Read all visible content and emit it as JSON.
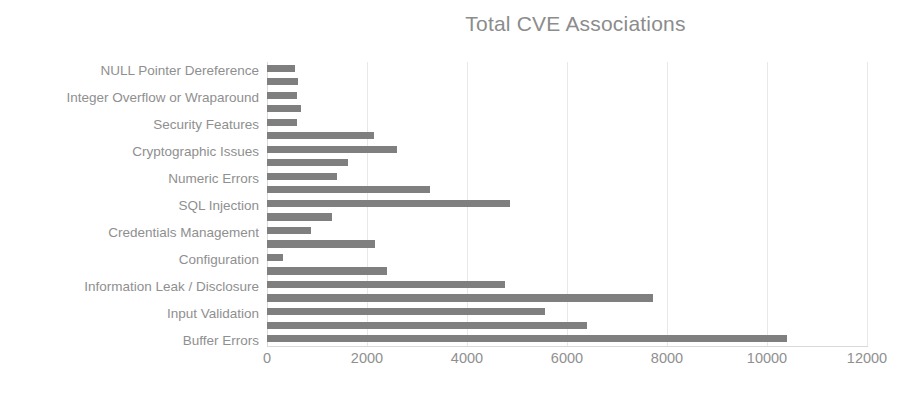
{
  "chart_data": {
    "type": "bar",
    "orientation": "horizontal",
    "title": "Total CVE Associations",
    "xlabel": "",
    "ylabel": "",
    "xlim": [
      0,
      12000
    ],
    "xticks": [
      0,
      2000,
      4000,
      6000,
      8000,
      10000,
      12000
    ],
    "xtick_labels": [
      "0",
      "2000",
      "4000",
      "6000",
      "8000",
      "10000",
      "12000"
    ],
    "grid": true,
    "grid_axis": "x",
    "legend": false,
    "bar_color": "#7f7f7f",
    "text_color": "#8f8f8f",
    "categories": [
      "NULL Pointer Dereference",
      "Integer Overflow or Wraparound",
      "Security Features",
      "Cryptographic Issues",
      "Numeric Errors",
      "SQL Injection",
      "Credentials Management",
      "Configuration",
      "Information Leak / Disclosure",
      "Input Validation",
      "Buffer Errors"
    ],
    "bars": [
      {
        "value": 560
      },
      {
        "value": 620
      },
      {
        "value": 590
      },
      {
        "value": 680
      },
      {
        "value": 600
      },
      {
        "value": 2140
      },
      {
        "value": 2600
      },
      {
        "value": 1620
      },
      {
        "value": 1400
      },
      {
        "value": 3260
      },
      {
        "value": 4850
      },
      {
        "value": 1300
      },
      {
        "value": 880
      },
      {
        "value": 2160
      },
      {
        "value": 320
      },
      {
        "value": 2400
      },
      {
        "value": 4750
      },
      {
        "value": 7720
      },
      {
        "value": 5550
      },
      {
        "value": 6400
      },
      {
        "value": 10400
      }
    ],
    "label_bar_indices": [
      0,
      2,
      4,
      6,
      8,
      10,
      12,
      14,
      16,
      18,
      20
    ]
  }
}
